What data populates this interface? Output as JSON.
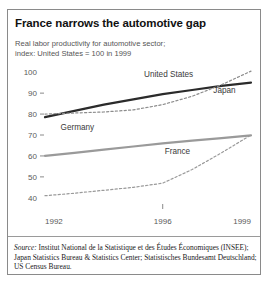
{
  "title": "France narrows the automotive gap",
  "subtitle_line1": "Real labor productivity for automotive sector;",
  "subtitle_line2": "index: United States = 100 in 1999",
  "source_label": "Source:",
  "source_text": " Institut National de la Statistique et des Études Économiques (INSEE); Japan Statistics Bureau & Statistics Center; Statistisches Bundesamt Deutschland; US Census Bureau.",
  "colors": {
    "united_states": "#2b2b2b",
    "japan": "#8c8c8c",
    "germany": "#9a9a9a",
    "france": "#9a9a9a",
    "frame": "#8a8a8a",
    "text": "#555555",
    "background": "#ffffff"
  },
  "chart_data": {
    "type": "line",
    "title": "France narrows the automotive gap",
    "subtitle": "Real labor productivity for automotive sector; index: United States = 100 in 1999",
    "xlabel": "",
    "ylabel": "",
    "x": [
      1992,
      1993,
      1994,
      1995,
      1996,
      1997,
      1998,
      1999
    ],
    "xticks": [
      "1992",
      "1996",
      "1999"
    ],
    "xtick_values": [
      1992,
      1996,
      1999
    ],
    "yticks": [
      "40",
      "50",
      "60",
      "70",
      "80",
      "90",
      "100"
    ],
    "ytick_values": [
      40,
      50,
      60,
      70,
      80,
      90,
      100
    ],
    "ylim": [
      38,
      102
    ],
    "xlim": [
      1992,
      1999
    ],
    "grid": false,
    "legend": "inline-labels",
    "series": [
      {
        "name": "United States",
        "style": "solid",
        "color": "#2b2b2b",
        "width": 2.2,
        "values": [
          78.5,
          81.5,
          84.5,
          87.0,
          89.5,
          91.5,
          93.5,
          95.0
        ],
        "label_x": 1996.2,
        "label_y": 97.5
      },
      {
        "name": "Japan",
        "style": "dashed",
        "color": "#8c8c8c",
        "width": 1.2,
        "values": [
          80.0,
          80.5,
          81.0,
          82.0,
          84.5,
          88.5,
          94.0,
          100.5
        ],
        "label_x": 1998.1,
        "label_y": 90.0
      },
      {
        "name": "Germany",
        "style": "solid",
        "color": "#9a9a9a",
        "width": 2.2,
        "values": [
          60.0,
          61.5,
          63.0,
          64.5,
          66.0,
          67.3,
          68.5,
          69.8
        ],
        "label_x": 1993.1,
        "label_y": 72.5
      },
      {
        "name": "France",
        "style": "dashed",
        "color": "#9a9a9a",
        "width": 1.2,
        "values": [
          41.0,
          42.2,
          43.6,
          45.0,
          47.0,
          53.5,
          61.5,
          70.0
        ],
        "label_x": 1996.5,
        "label_y": 61.0
      }
    ]
  }
}
